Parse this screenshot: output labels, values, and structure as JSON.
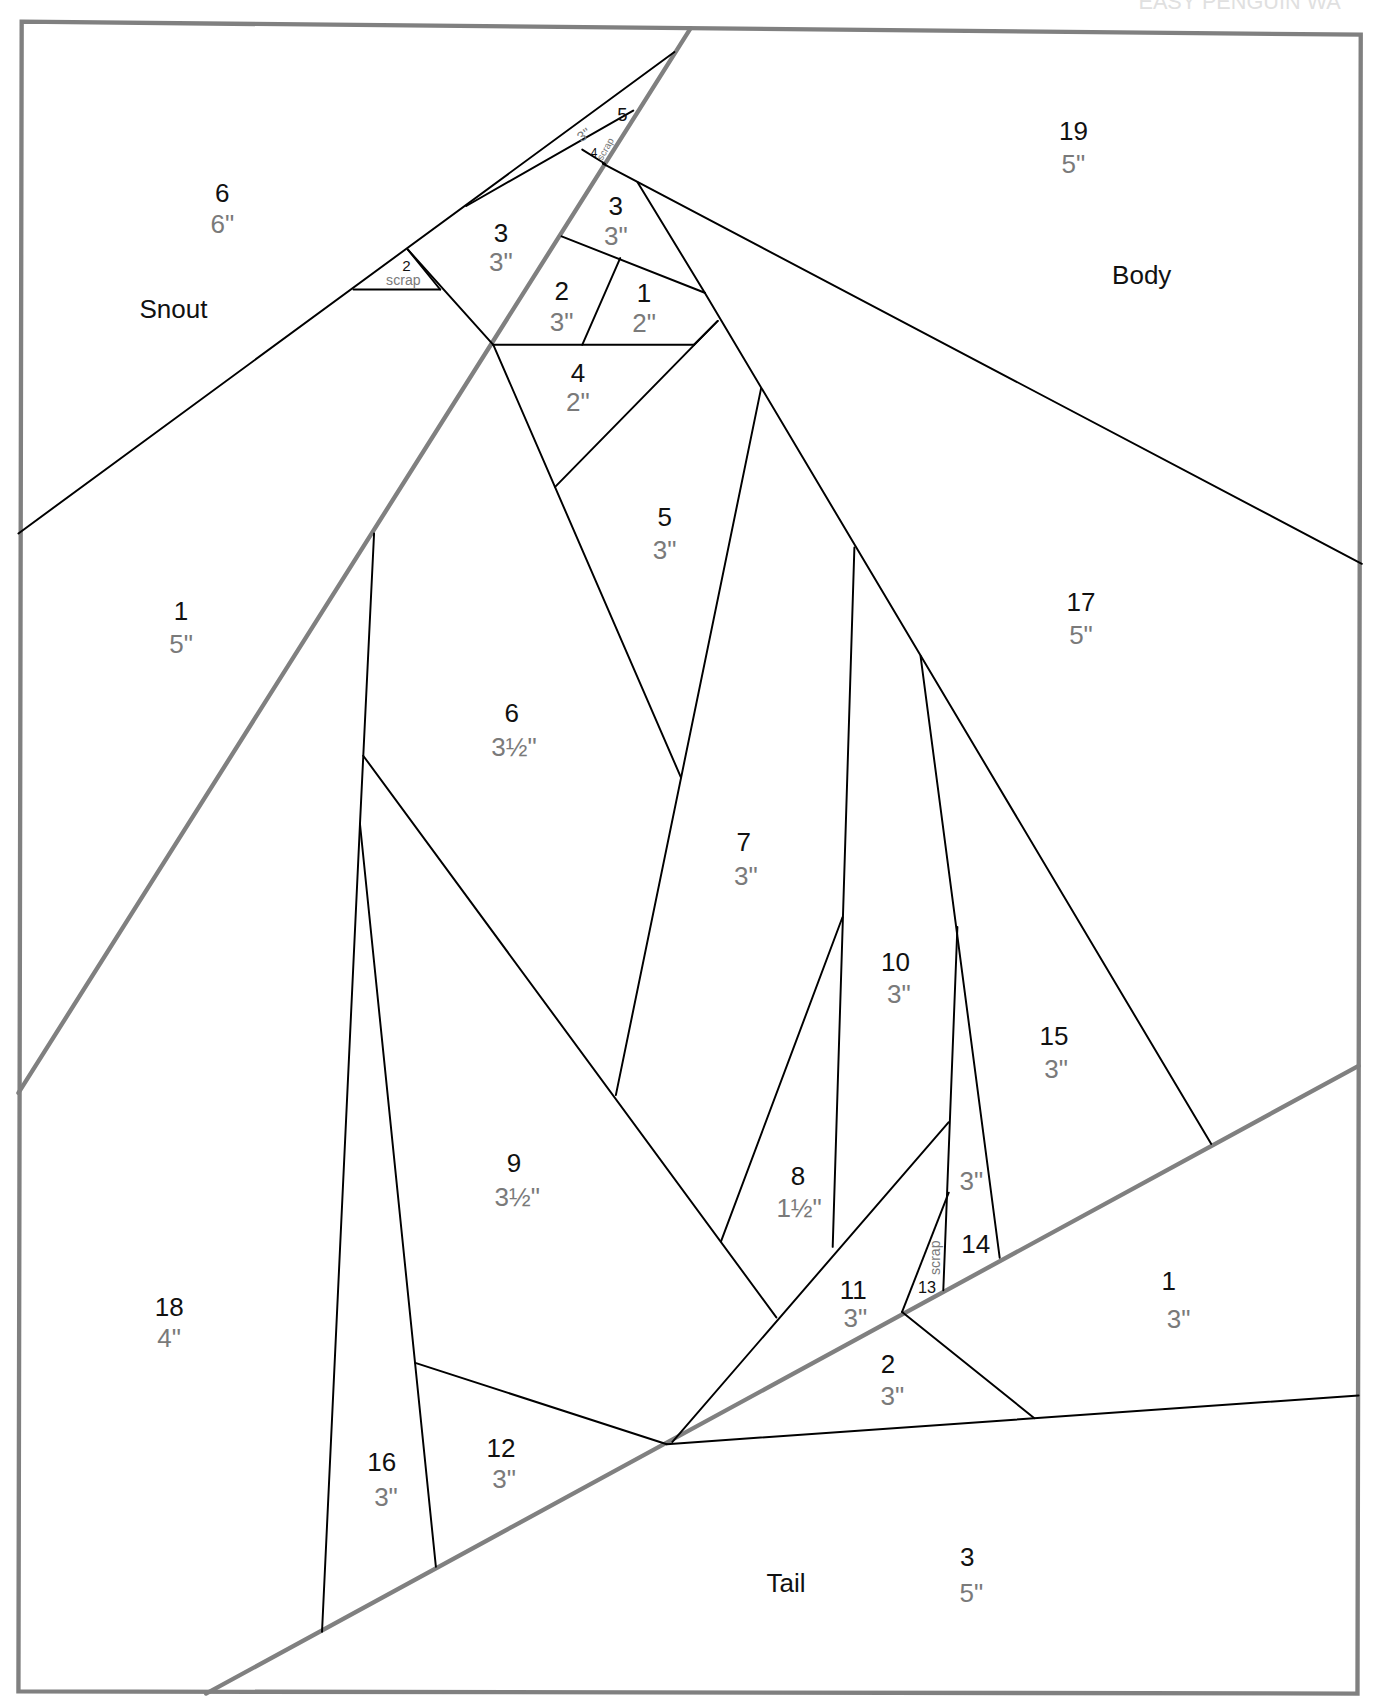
{
  "header": {
    "title_fragment": "EASY PENGUIN WA"
  },
  "colors": {
    "frame": "#808080",
    "seam": "#000000",
    "number": "#111111",
    "size": "#7a7a7a"
  },
  "sections": {
    "snout": "Snout",
    "body": "Body",
    "tail": "Tail"
  },
  "pieces": {
    "snout_6": {
      "num": "6",
      "size": "6\""
    },
    "snout_3": {
      "num": "3",
      "size": "3\""
    },
    "snout_2": {
      "num": "2",
      "size": "scrap"
    },
    "snout_1": {
      "num": "1",
      "size": "5\""
    },
    "snout_5": {
      "num": "5",
      "size": "3\""
    },
    "snout_4": {
      "num": "4",
      "size": "scrap"
    },
    "head_3": {
      "num": "3",
      "size": "3\""
    },
    "head_2": {
      "num": "2",
      "size": "3\""
    },
    "head_1": {
      "num": "1",
      "size": "2\""
    },
    "head_4": {
      "num": "4",
      "size": "2\""
    },
    "body_19": {
      "num": "19",
      "size": "5\""
    },
    "body_17": {
      "num": "17",
      "size": "5\""
    },
    "body_5": {
      "num": "5",
      "size": "3\""
    },
    "body_6": {
      "num": "6",
      "size": "3½\""
    },
    "body_7": {
      "num": "7",
      "size": "3\""
    },
    "body_9": {
      "num": "9",
      "size": "3½\""
    },
    "body_8": {
      "num": "8",
      "size": "1½\""
    },
    "body_10": {
      "num": "10",
      "size": "3\""
    },
    "body_15": {
      "num": "15",
      "size": "3\""
    },
    "body_14": {
      "num": "14",
      "size": "3\""
    },
    "body_13": {
      "num": "13",
      "size": "scrap"
    },
    "body_11": {
      "num": "11",
      "size": "3\""
    },
    "body_12": {
      "num": "12",
      "size": "3\""
    },
    "body_16": {
      "num": "16",
      "size": "3\""
    },
    "body_18": {
      "num": "18",
      "size": "4\""
    },
    "tail_1": {
      "num": "1",
      "size": "3\""
    },
    "tail_2": {
      "num": "2",
      "size": "3\""
    },
    "tail_3": {
      "num": "3",
      "size": "5\""
    }
  }
}
